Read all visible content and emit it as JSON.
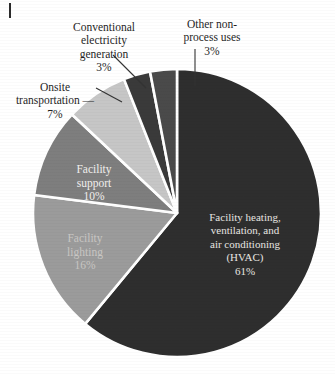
{
  "chart_data": {
    "type": "pie",
    "title": "",
    "subtitle": "",
    "xlabel": "",
    "ylabel": "",
    "legend_position": "none",
    "grid": false,
    "units": "percent",
    "total": 100,
    "start_angle_deg": 0,
    "direction": "clockwise",
    "categories": [
      "Facility heating, ventilation, and air conditioning (HVAC)",
      "Facility lighting",
      "Facility support",
      "Onsite transportation",
      "Conventional electricity generation",
      "Other non-process uses"
    ],
    "values": [
      61,
      16,
      10,
      7,
      3,
      3
    ],
    "slices": [
      {
        "key": "hvac",
        "label": "Facility heating,\nventilation, and\nair conditioning\n(HVAC)",
        "label_flat": "Facility heating, ventilation, and air conditioning (HVAC)",
        "value": 61,
        "percent_text": "61%",
        "color": "#2e2e2e",
        "label_placement": "inside",
        "label_color": "#e8e6e2"
      },
      {
        "key": "facility-lighting",
        "label": "Facility\nlighting",
        "label_flat": "Facility lighting",
        "value": 16,
        "percent_text": "16%",
        "color": "#9b9b9b",
        "label_placement": "inside",
        "label_color": "#c9c7c4"
      },
      {
        "key": "facility-support",
        "label": "Facility\nsupport",
        "label_flat": "Facility support",
        "value": 10,
        "percent_text": "10%",
        "color": "#7e7e7e",
        "label_placement": "inside",
        "label_color": "#f2f0ee"
      },
      {
        "key": "onsite-transportation",
        "label": "Onsite\ntransportation",
        "label_flat": "Onsite transportation",
        "value": 7,
        "percent_text": "7%",
        "color": "#c6c6c6",
        "label_placement": "outside",
        "label_color": "#1f1f1f"
      },
      {
        "key": "conventional-electricity-generation",
        "label": "Conventional\nelectricity\ngeneration",
        "label_flat": "Conventional electricity generation",
        "value": 3,
        "percent_text": "3%",
        "color": "#3a3a3a",
        "label_placement": "outside",
        "label_color": "#1f1f1f"
      },
      {
        "key": "other-non-process-uses",
        "label": "Other non-\nprocess uses",
        "label_flat": "Other non-process uses",
        "value": 3,
        "percent_text": "3%",
        "color": "#4a4a4a",
        "label_placement": "outside",
        "label_color": "#1f1f1f"
      }
    ]
  },
  "geometry": {
    "center_x": 177,
    "center_y": 213,
    "radius": 144,
    "gap_color": "#ffffff",
    "gap_width": 2.6
  },
  "labels": {
    "conventional": {
      "text": "Conventional\nelectricity\ngeneration",
      "percent": "3%"
    },
    "other": {
      "text": "Other non-\nprocess uses",
      "percent": "3%"
    },
    "onsite": {
      "text": "Onsite\ntransportation —",
      "percent": "7%"
    },
    "hvac": {
      "text": "Facility heating,\nventilation, and\nair conditioning\n(HVAC)",
      "percent": "61%"
    },
    "support": {
      "text": "Facility\nsupport",
      "percent": "10%"
    },
    "lighting": {
      "text": "Facility\nlighting",
      "percent": "16%"
    }
  }
}
